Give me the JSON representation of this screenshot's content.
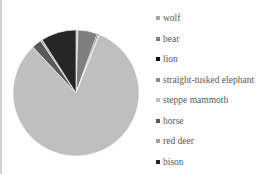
{
  "chart_data": {
    "type": "pie",
    "title": "",
    "start_angle": "12 o'clock, clockwise",
    "categories": [
      "wolf",
      "bear",
      "lion",
      "straight-tusked elephant",
      "steppe mammoth",
      "horse",
      "red deer",
      "bison"
    ],
    "values": [
      0.5,
      5,
      0.3,
      0.3,
      82,
      2.5,
      0.5,
      9
    ],
    "colors": [
      "#a6a6a6",
      "#7f7f7f",
      "#0d0d0d",
      "#8c8c8c",
      "#bfbfbf",
      "#595959",
      "#a0a0a0",
      "#262626"
    ],
    "legend_position": "right"
  },
  "legend": {
    "items": [
      {
        "label": "wolf"
      },
      {
        "label": "bear"
      },
      {
        "label": "lion"
      },
      {
        "label": "straight-tusked elephant"
      },
      {
        "label": "steppe mammoth"
      },
      {
        "label": "horse"
      },
      {
        "label": "red deer"
      },
      {
        "label": "bison"
      }
    ]
  }
}
